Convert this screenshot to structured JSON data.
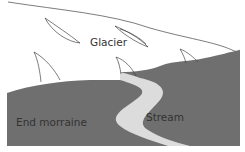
{
  "diagram": {
    "labels": {
      "glacier": "Glacier",
      "end_moraine": "End morraine",
      "stream": "Stream"
    },
    "colors": {
      "ground": "#6f6f6f",
      "stream": "#dcdcdc",
      "glacier": "#ffffff",
      "outline": "#444444",
      "text": "#333333"
    }
  }
}
